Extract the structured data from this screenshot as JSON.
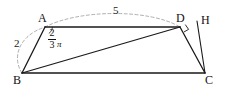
{
  "figure": {
    "kind": "geometry-diagram",
    "shape": "quadrilateral",
    "background_color": "#ffffff",
    "stroke_color": "#1a1a1a",
    "dash_color": "#8c8c8c"
  },
  "vertices": {
    "A": {
      "label": "A",
      "x": 45,
      "y": 27
    },
    "B": {
      "label": "B",
      "x": 22,
      "y": 73
    },
    "C": {
      "label": "C",
      "x": 205,
      "y": 73
    },
    "D": {
      "label": "D",
      "x": 180,
      "y": 27
    },
    "H": {
      "label": "H",
      "x": 197,
      "y": 21
    }
  },
  "segments": [
    {
      "name": "AB",
      "from": "A",
      "to": "B",
      "style": "solid"
    },
    {
      "name": "AD",
      "from": "A",
      "to": "D",
      "style": "solid"
    },
    {
      "name": "BC",
      "from": "B",
      "to": "C",
      "style": "solid"
    },
    {
      "name": "BD",
      "from": "B",
      "to": "D",
      "style": "solid"
    },
    {
      "name": "DC",
      "from": "D",
      "to": "C",
      "style": "solid"
    },
    {
      "name": "HC",
      "from": "H",
      "to": "C",
      "style": "solid"
    }
  ],
  "measures": {
    "AB": {
      "value": "2",
      "on_segment": "AB"
    },
    "AD": {
      "value": "5",
      "on_segment": "AD"
    }
  },
  "angles": {
    "at_A": {
      "vertex": "A",
      "numerator": "2",
      "denominator": "3",
      "symbol": "π",
      "text": "2/3 π"
    },
    "at_D": {
      "vertex": "D",
      "type": "right-angle",
      "marker": "square"
    }
  }
}
